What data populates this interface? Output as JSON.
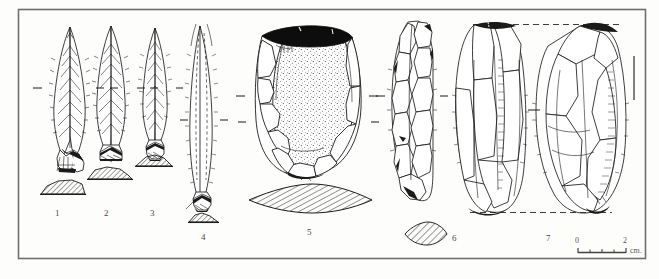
{
  "plate": {
    "background_color": "#fdfdfc",
    "ink_color": "#1b1b1b",
    "frame_color": "#6b6b6b",
    "label_color": "#4a4a4a",
    "frame": {
      "x": 18,
      "y": 9,
      "width": 627,
      "height": 249
    }
  },
  "figures": [
    {
      "number": "1",
      "label_x": 57,
      "label_y": 214,
      "kind": "tanged-point",
      "description": "flint tanged point, bifacially retouched, with basal tang",
      "outline_x": 55,
      "outline_y": 26,
      "outline_w": 30,
      "outline_h": 145,
      "section": {
        "x": 41,
        "y": 180,
        "w": 44,
        "h": 14,
        "shape": "trapezoid",
        "hatch": "diagonal"
      }
    },
    {
      "number": "2",
      "label_x": 106,
      "label_y": 214,
      "kind": "leaf-point",
      "description": "flint leaf-shaped point with retouched base",
      "outline_x": 96,
      "outline_y": 25,
      "outline_w": 30,
      "outline_h": 140,
      "section": {
        "x": 88,
        "y": 166,
        "w": 44,
        "h": 13,
        "shape": "trapezoid",
        "hatch": "diagonal"
      }
    },
    {
      "number": "3",
      "label_x": 152,
      "label_y": 214,
      "kind": "blade-point",
      "description": "narrow flint blade point, edge-retouched",
      "outline_x": 142,
      "outline_y": 27,
      "outline_w": 26,
      "outline_h": 133,
      "section": {
        "x": 136,
        "y": 155,
        "w": 36,
        "h": 11,
        "shape": "triangular",
        "hatch": "diagonal"
      }
    },
    {
      "number": "4",
      "label_x": 203,
      "label_y": 229,
      "kind": "long-blade",
      "description": "elongated flint blade with dorsal ridge, struck base",
      "outline_x": 189,
      "outline_y": 24,
      "outline_w": 28,
      "outline_h": 185,
      "section": {
        "x": 189,
        "y": 213,
        "w": 30,
        "h": 10,
        "shape": "low-arch",
        "hatch": "diagonal"
      }
    },
    {
      "number": "5",
      "label_x": 308,
      "label_y": 224,
      "kind": "core-scraper",
      "description": "large flint flake tool with black cortex along upper edge and stippled ventral surface",
      "outline_x": 253,
      "outline_y": 20,
      "outline_w": 110,
      "outline_h": 155,
      "section": {
        "x": 248,
        "y": 185,
        "w": 124,
        "h": 28,
        "shape": "lenticular",
        "hatch": "diagonal"
      }
    },
    {
      "number": "6",
      "label_x": 452,
      "label_y": 238,
      "kind": "flaked-blade",
      "description": "elongated bifacially flaked flint implement",
      "outline_x": 392,
      "outline_y": 22,
      "outline_w": 42,
      "outline_h": 180,
      "section": {
        "x": 405,
        "y": 224,
        "w": 42,
        "h": 20,
        "shape": "lenticular",
        "hatch": "diagonal"
      }
    },
    {
      "number": "7",
      "label_x": 547,
      "label_y": 238,
      "kind": "core-two-views",
      "description": "flint core shown in two joined views, aligned by dashed registration lines",
      "outline_x": 452,
      "outline_y": 23,
      "outline_w": 175,
      "outline_h": 193,
      "section": null
    }
  ],
  "registration_marks": {
    "description": "short dashed alignment ticks flanking each artifact at its mid-height axis",
    "count": 18
  },
  "scale_bar": {
    "start_label": "0",
    "end_label": "2",
    "unit_label": "cm.",
    "x": 578,
    "y": 246,
    "length": 48,
    "divisions": 4
  }
}
